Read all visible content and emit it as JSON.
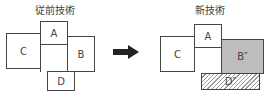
{
  "left": {
    "title": "従前技術",
    "boxes": {
      "a": "A",
      "b": "B",
      "c": "C",
      "d": "D"
    }
  },
  "right": {
    "title": "新技術",
    "boxes": {
      "a": "A",
      "b": "B″",
      "c": "C",
      "d": "D″"
    }
  },
  "arrow": "right-arrow-icon",
  "colors": {
    "line": "#444444",
    "gray_fill": "#bdbdbd"
  }
}
